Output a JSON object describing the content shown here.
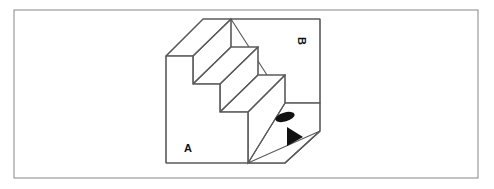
{
  "figure": {
    "background_color": "#ffffff",
    "frame": {
      "name": "outer-border",
      "x": 14,
      "y": 10,
      "width": 464,
      "height": 168,
      "stroke_color": "#9a9a9a",
      "fill_color": "#ffffff"
    },
    "solid": {
      "line_color": "#5a5a5a",
      "fill_color": "#ffffff",
      "step_count": 3,
      "front_face_outline": "166,56 193,56 193,84 220,84 220,112 248,112 248,163 166,163",
      "top_treads": [
        "166,56 203,19 231,19 193,56",
        "193,84 231,47 258,47 220,84",
        "220,112 258,75 285,75 248,112"
      ],
      "risers": [
        "193,56 231,19 231,47 193,84",
        "220,84 258,47 258,75 220,112",
        "248,112 285,75 285,103 248,163"
      ],
      "back_panel": "231,19 320,19 320,103 285,103",
      "right_side": "248,163 285,103 320,103 320,131 285,163",
      "bottom_right_wedge": "248,163 285,163 320,131"
    },
    "labels": [
      {
        "id": "label-a",
        "text": "A",
        "x": 188,
        "y": 152,
        "rotation_deg": 0
      },
      {
        "id": "label-b",
        "text": "B",
        "x": 298,
        "y": 41,
        "rotation_deg": 90
      }
    ],
    "markers": [
      {
        "id": "ellipse-marker",
        "shape": "ellipse",
        "cx": 285,
        "cy": 117,
        "rx": 10,
        "ry": 4.5,
        "color": "#111111"
      },
      {
        "id": "triangle-marker",
        "shape": "triangle-right",
        "points": "287,127 287,146 303,137",
        "color": "#111111"
      }
    ]
  }
}
